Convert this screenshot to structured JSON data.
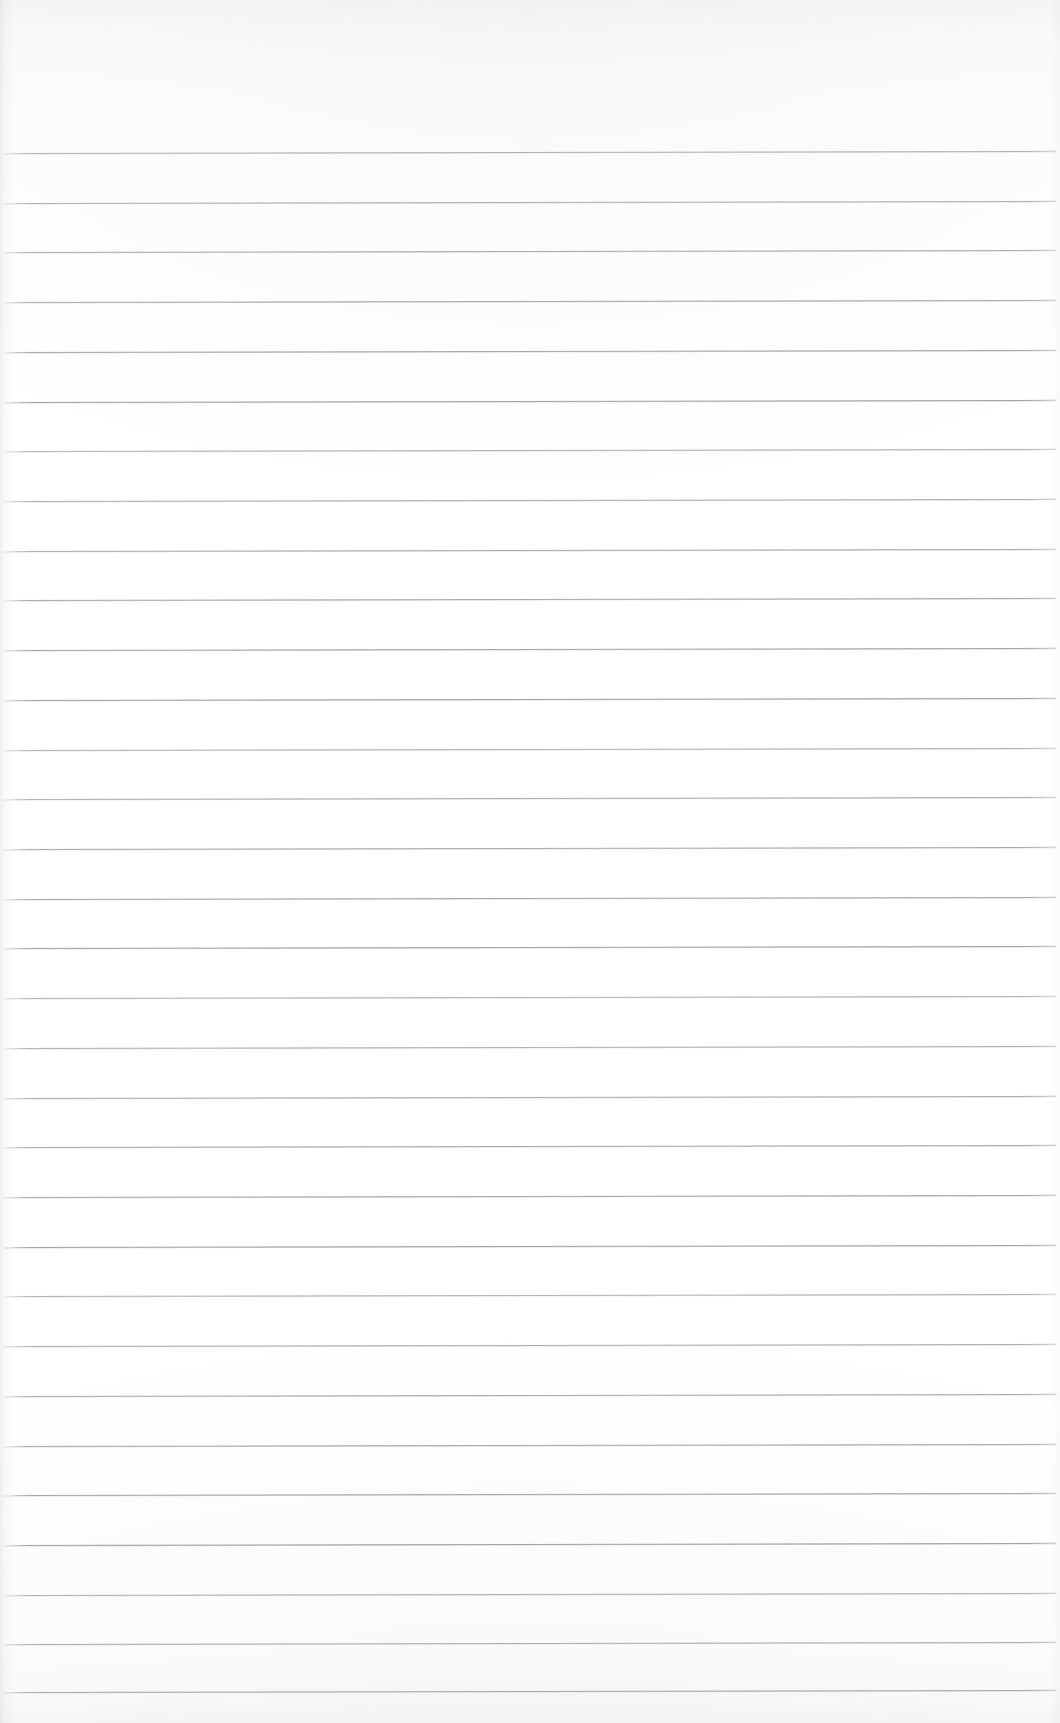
{
  "document": {
    "type": "ruled-notebook-page",
    "title": "Blank Ruled Notebook Page",
    "content_text": "",
    "has_written_content": false,
    "page_width_px": 1060,
    "page_height_px": 1723
  },
  "paper": {
    "background_color": "#fefefe",
    "texture_note_color": "#f7f7f8",
    "top_margin_px": 153,
    "left_edge_shadow_color": "#8c8c92"
  },
  "ruling": {
    "line_color": "#a2a2a7",
    "line_highlight_color": "#b9b9be",
    "line_thickness_px": 1,
    "line_count": 32,
    "first_line_y_px": 153,
    "line_spacing_px": 49.65,
    "line_left_x_px": 4,
    "line_right_x_px": 1056,
    "slope_deg": -0.12,
    "line_y_positions": [
      153,
      203,
      252,
      302,
      352,
      402,
      451,
      501,
      551,
      600,
      650,
      700,
      750,
      799,
      849,
      899,
      948,
      998,
      1048,
      1098,
      1147,
      1197,
      1247,
      1296,
      1346,
      1396,
      1446,
      1495,
      1545,
      1595,
      1644,
      1692
    ]
  }
}
